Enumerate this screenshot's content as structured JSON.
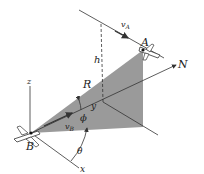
{
  "diagram": {
    "labels": {
      "A": "A",
      "B": "B",
      "N": "N",
      "R": "R",
      "h": "h",
      "z": "z",
      "x": "x",
      "y": "y",
      "vA_main": "v",
      "vA_sub": "A",
      "vB_main": "v",
      "vB_sub": "B",
      "phi": "ϕ",
      "theta": "θ"
    },
    "colors": {
      "plane_fill": "#9a9a9a",
      "line": "#333333",
      "background": "#ffffff"
    }
  }
}
